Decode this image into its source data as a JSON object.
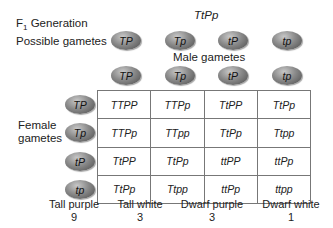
{
  "header": {
    "f1_label": "F",
    "f1_sub": "1",
    "f1_suffix": " Generation",
    "f1_genotype": "TtPp",
    "possible_gametes_label": "Possible gametes",
    "possible_gametes": [
      "TP",
      "Tp",
      "tP",
      "tp"
    ]
  },
  "male": {
    "label": "Male gametes",
    "gametes": [
      "TP",
      "Tp",
      "tP",
      "tp"
    ]
  },
  "female": {
    "label_line1": "Female",
    "label_line2": "gametes",
    "gametes": [
      "TP",
      "Tp",
      "tP",
      "tp"
    ]
  },
  "punnett": {
    "rows": [
      [
        "TTPP",
        "TTPp",
        "TtPP",
        "TtPp"
      ],
      [
        "TTPp",
        "TTpp",
        "TtPp",
        "Ttpp"
      ],
      [
        "TtPP",
        "TtPp",
        "ttPP",
        "ttPp"
      ],
      [
        "TtPp",
        "Ttpp",
        "ttPp",
        "ttpp"
      ]
    ]
  },
  "phenotypes": [
    {
      "name": "Tall purple",
      "count": "9"
    },
    {
      "name": "Tall white",
      "count": "3"
    },
    {
      "name": "Dwarf purple",
      "count": "3"
    },
    {
      "name": "Dwarf white",
      "count": "1"
    }
  ],
  "colors": {
    "oval_dark": "#4a4a4a",
    "oval_light": "#c8c8c8",
    "grid_line": "#777777"
  }
}
